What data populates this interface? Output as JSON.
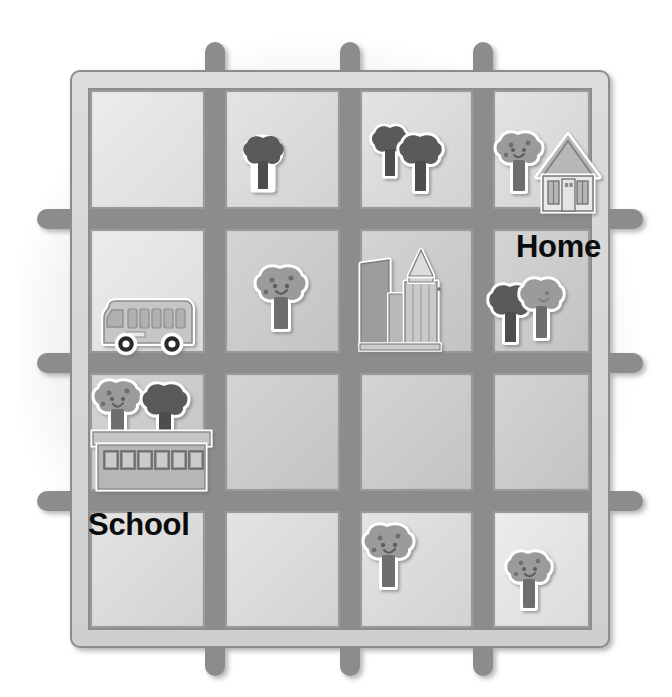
{
  "map": {
    "title": "Neighborhood street grid map",
    "grid": {
      "rows": 4,
      "cols": 4
    },
    "labels": [
      {
        "id": "home",
        "text": "Home",
        "x": 516,
        "y": 231
      },
      {
        "id": "school",
        "text": "School",
        "x": 88,
        "y": 509
      }
    ],
    "colors": {
      "road_fill": "#d2d2d2",
      "road_stroke": "#8e8e8e",
      "block_fill_light": "#e2e2e2",
      "block_fill_mid": "#c9c9c9",
      "block_stroke": "#9a9a9a",
      "tree_dark": "#5a5a5a",
      "tree_light": "#9a9a9a",
      "trunk_dark": "#4a4a4a",
      "trunk_mid": "#6d6d6d",
      "building_light": "#cfcfcf",
      "building_mid": "#b5b5b5",
      "building_dark": "#8a8a8a",
      "outline_white": "#ffffff",
      "text": "#0b0b0b"
    },
    "cells": [
      {
        "row": 1,
        "col": 1,
        "contents": []
      },
      {
        "row": 1,
        "col": 2,
        "contents": [
          "tree-dark"
        ]
      },
      {
        "row": 1,
        "col": 3,
        "contents": [
          "tree-dark",
          "tree-dark"
        ]
      },
      {
        "row": 1,
        "col": 4,
        "contents": [
          "tree-light-face",
          "house"
        ]
      },
      {
        "row": 2,
        "col": 1,
        "contents": [
          "bus"
        ]
      },
      {
        "row": 2,
        "col": 2,
        "contents": [
          "tree-light-face"
        ]
      },
      {
        "row": 2,
        "col": 3,
        "contents": [
          "city-buildings"
        ]
      },
      {
        "row": 2,
        "col": 4,
        "contents": [
          "tree-dark",
          "tree-light"
        ]
      },
      {
        "row": 3,
        "col": 1,
        "contents": [
          "tree-light-face",
          "tree-dark",
          "school-building"
        ]
      },
      {
        "row": 3,
        "col": 2,
        "contents": []
      },
      {
        "row": 3,
        "col": 3,
        "contents": []
      },
      {
        "row": 3,
        "col": 4,
        "contents": []
      },
      {
        "row": 4,
        "col": 1,
        "contents": []
      },
      {
        "row": 4,
        "col": 2,
        "contents": []
      },
      {
        "row": 4,
        "col": 3,
        "contents": [
          "tree-light-face"
        ]
      },
      {
        "row": 4,
        "col": 4,
        "contents": [
          "tree-light-face"
        ]
      }
    ],
    "icons": {
      "house": "house-icon",
      "school_building": "school-building-icon",
      "bus": "bus-icon",
      "city": "city-buildings-icon",
      "tree_dark": "tree-dark-icon",
      "tree_light": "tree-light-icon",
      "tree_light_face": "tree-smiling-icon"
    }
  }
}
